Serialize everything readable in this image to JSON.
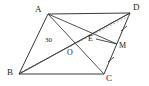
{
  "figure": {
    "type": "geometry-diagram",
    "shape": "parallelogram",
    "width": 149,
    "height": 86,
    "background_color": "#ffffff",
    "stroke_color": "#3a3a3a",
    "dashed_stroke_color": "#8a8a8a",
    "label_color": "#1b1b1b"
  },
  "vertices": {
    "A": {
      "label": "A",
      "x": 48,
      "y": 14,
      "label_x": 35,
      "label_y": 6
    },
    "B": {
      "label": "B",
      "x": 19,
      "y": 74,
      "label_x": 8,
      "label_y": 70
    },
    "C": {
      "label": "C",
      "x": 104,
      "y": 74,
      "label_x": 107,
      "label_y": 74
    },
    "D": {
      "label": "D",
      "x": 130,
      "y": 13,
      "label_x": 133,
      "label_y": 4
    }
  },
  "points": {
    "O": {
      "label": "O",
      "x": 74,
      "y": 50,
      "label_x": 68,
      "label_y": 51
    },
    "E": {
      "label": "E",
      "x": 96,
      "y": 39,
      "label_x": 89,
      "label_y": 37
    },
    "M": {
      "label": "M",
      "x": 117,
      "y": 44,
      "label_x": 119,
      "label_y": 44
    }
  },
  "angles": [
    {
      "name": "angle-at-B",
      "label": "30",
      "x": 47,
      "y": 39
    }
  ],
  "segments": [
    {
      "name": "side-AB",
      "from": "A",
      "to": "B",
      "style": "solid"
    },
    {
      "name": "side-BC",
      "from": "B",
      "to": "C",
      "style": "solid"
    },
    {
      "name": "side-CD",
      "from": "C",
      "to": "D",
      "style": "solid"
    },
    {
      "name": "side-DA",
      "from": "D",
      "to": "A",
      "style": "solid"
    },
    {
      "name": "diagonal-AC",
      "from": "A",
      "to": "C",
      "style": "solid"
    },
    {
      "name": "diagonal-BD",
      "from": "B",
      "to": "D",
      "style": "solid"
    },
    {
      "name": "dashed-BD",
      "from": "B",
      "to": "D",
      "style": "dashed"
    },
    {
      "name": "segment-AM",
      "from": "A",
      "to": "M",
      "style": "solid"
    },
    {
      "name": "segment-DE-extended",
      "from": "D",
      "to": "B",
      "style": "solid"
    },
    {
      "name": "segment-EM",
      "from": "E",
      "to": "M",
      "style": "solid"
    }
  ],
  "tick_marks": [
    {
      "name": "tick-DM",
      "segment": "D-M",
      "x": 124,
      "y": 28
    },
    {
      "name": "tick-MC",
      "segment": "M-C",
      "x": 111,
      "y": 60
    }
  ]
}
